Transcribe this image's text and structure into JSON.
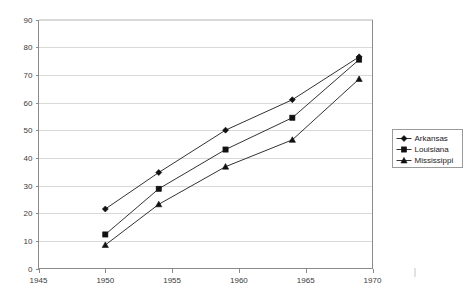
{
  "chart_data": {
    "type": "line",
    "title": "",
    "subtitle": "",
    "xlabel": "",
    "ylabel": "",
    "xlim": [
      1945,
      1970
    ],
    "ylim": [
      0,
      90
    ],
    "x": [
      1950,
      1954,
      1959,
      1964,
      1969
    ],
    "xticks": [
      "1945",
      "1950",
      "1955",
      "1960",
      "1965",
      "1970"
    ],
    "xtick_values": [
      1945,
      1950,
      1955,
      1960,
      1965,
      1970
    ],
    "yticks": [
      "0",
      "10",
      "20",
      "30",
      "40",
      "50",
      "60",
      "70",
      "80",
      "90"
    ],
    "ytick_values": [
      0,
      10,
      20,
      30,
      40,
      50,
      60,
      70,
      80,
      90
    ],
    "grid": "horizontal",
    "legend_position": "right",
    "series": [
      {
        "name": "Arkansas",
        "marker": "diamond",
        "color": "#333333",
        "values": [
          21.5,
          34.7,
          50.0,
          61.0,
          76.5
        ]
      },
      {
        "name": "Louisiana",
        "marker": "square",
        "color": "#333333",
        "values": [
          12.3,
          28.8,
          43.0,
          54.5,
          75.5
        ]
      },
      {
        "name": "Mississippi",
        "marker": "triangle",
        "color": "#333333",
        "values": [
          8.5,
          23.2,
          36.8,
          46.5,
          68.5
        ]
      }
    ]
  },
  "legend": {
    "items": [
      "Arkansas",
      "Louisiana",
      "Mississippi"
    ]
  }
}
